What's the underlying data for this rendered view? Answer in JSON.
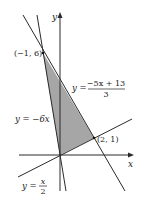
{
  "figure": {
    "type": "feasible-region-graph",
    "axes": {
      "x_label": "x",
      "y_label": "y",
      "origin_px": [
        60,
        155
      ],
      "px_per_unit": 17
    },
    "region": {
      "fill": "#a6a6a6",
      "vertices": [
        [
          -1,
          6
        ],
        [
          2,
          1
        ],
        [
          0,
          0
        ]
      ]
    },
    "lines": [
      {
        "id": "line-a",
        "equation": "y = (-5x + 13)/3",
        "label_lhs": "y =",
        "label_num": "−5x + 13",
        "label_den": "3"
      },
      {
        "id": "line-b",
        "equation": "y = -6x",
        "label": "y = −6x"
      },
      {
        "id": "line-c",
        "equation": "y = x/2",
        "label_lhs": "y =",
        "label_num": "x",
        "label_den": "2"
      }
    ],
    "points": [
      {
        "label": "(−1, 6)",
        "x": -1,
        "y": 6
      },
      {
        "label": "(2, 1)",
        "x": 2,
        "y": 1
      }
    ],
    "line_color": "#2a2a2a"
  }
}
